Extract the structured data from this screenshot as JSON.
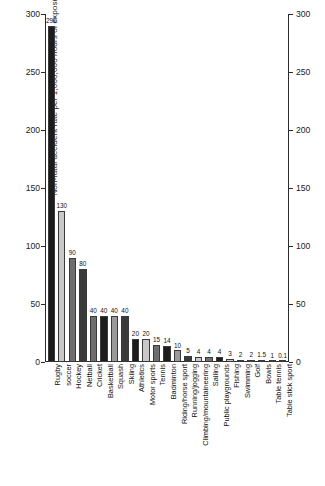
{
  "chart_data": {
    "type": "bar",
    "title": "",
    "xlabel": "",
    "ylabel": "Non-fatal accident rate per 1,000,000 hours of exposure",
    "ylim": [
      0,
      300
    ],
    "yticks": [
      0,
      50,
      100,
      150,
      200,
      250,
      300
    ],
    "right_axis": true,
    "right_yticks": [
      0,
      50,
      100,
      150,
      200,
      250,
      300
    ],
    "grid": false,
    "legend": "none",
    "categories": [
      "Rugby",
      "soccer",
      "Hockey",
      "Netball",
      "Cricket",
      "Basketball",
      "Squash",
      "Skiing",
      "Athletics",
      "Motor sports",
      "Tennis",
      "Badminton",
      "Riding/horse sport",
      "Running/jogging",
      "Climbing/mountaineering",
      "Sailing",
      "Public playgrounds",
      "Fishing",
      "Swimming",
      "Golf",
      "Bowls",
      "Table tennis",
      "Table stick sport"
    ],
    "values": [
      290,
      130,
      90,
      80,
      40,
      40,
      40,
      40,
      20,
      20,
      15,
      14,
      10,
      5,
      4,
      4,
      4,
      3,
      2,
      2,
      1.5,
      1,
      0.1
    ],
    "value_labels": [
      "290",
      "130",
      "90",
      "80",
      "40",
      "40",
      "40",
      "40",
      "20",
      "20",
      "15",
      "14",
      "10",
      "5",
      "4",
      "4",
      "4",
      "3",
      "2",
      "2",
      "1.5",
      "1",
      "0.1"
    ],
    "bar_colors": [
      "#1c1c1c",
      "#c8c8c8",
      "#6e6e6e",
      "#3a3a3a",
      "#6e6e6e",
      "#1c1c1c",
      "#9a9a9a",
      "#3a3a3a",
      "#1c1c1c",
      "#c8c8c8",
      "#6e6e6e",
      "#1c1c1c",
      "#9a9a9a",
      "#3a3a3a",
      "#c8c8c8",
      "#6e6e6e",
      "#1c1c1c",
      "#c8c8c8",
      "#6e6e6e",
      "#3a3a3a",
      "#1c1c1c",
      "#9a9a9a",
      "#6e6e6e"
    ]
  }
}
